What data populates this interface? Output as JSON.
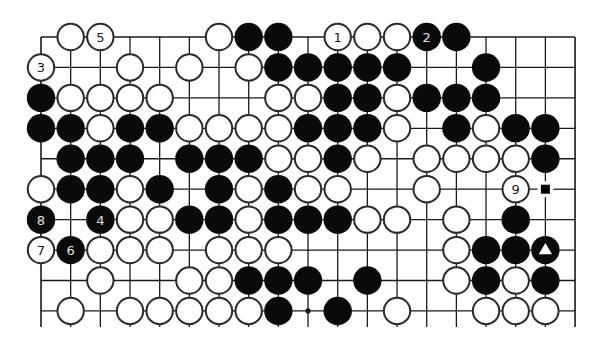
{
  "diagram": {
    "type": "go-board-fragment",
    "grid": {
      "origin_x": 41,
      "origin_y": 37,
      "dx": 29.67,
      "dy": 30.44,
      "cols": 19,
      "rows": 10,
      "line_bottom_y": 327,
      "edges": {
        "top": true,
        "left": true,
        "right": true,
        "bottom": false
      },
      "line_color": "#1a1a1a"
    },
    "stone_radius": 13.6,
    "colors": {
      "black": "#0a0a0a",
      "white": "#ffffff",
      "outline": "#2a2a2a",
      "label_on_white": "#1a1a1a",
      "label_on_black": "#e0e0e0"
    },
    "star_points": [
      {
        "row": 9,
        "col": 9
      }
    ],
    "stones": [
      {
        "r": 0,
        "c": 1,
        "color": "W"
      },
      {
        "r": 0,
        "c": 2,
        "color": "W",
        "label": "5"
      },
      {
        "r": 0,
        "c": 6,
        "color": "W"
      },
      {
        "r": 0,
        "c": 7,
        "color": "B"
      },
      {
        "r": 0,
        "c": 8,
        "color": "B"
      },
      {
        "r": 0,
        "c": 10,
        "color": "W",
        "label": "1"
      },
      {
        "r": 0,
        "c": 11,
        "color": "W"
      },
      {
        "r": 0,
        "c": 12,
        "color": "W"
      },
      {
        "r": 0,
        "c": 13,
        "color": "B",
        "label": "2"
      },
      {
        "r": 0,
        "c": 14,
        "color": "B"
      },
      {
        "r": 1,
        "c": 0,
        "color": "W",
        "label": "3"
      },
      {
        "r": 1,
        "c": 3,
        "color": "W"
      },
      {
        "r": 1,
        "c": 5,
        "color": "W"
      },
      {
        "r": 1,
        "c": 7,
        "color": "W"
      },
      {
        "r": 1,
        "c": 8,
        "color": "B"
      },
      {
        "r": 1,
        "c": 9,
        "color": "B"
      },
      {
        "r": 1,
        "c": 10,
        "color": "B"
      },
      {
        "r": 1,
        "c": 11,
        "color": "B"
      },
      {
        "r": 1,
        "c": 12,
        "color": "B"
      },
      {
        "r": 1,
        "c": 15,
        "color": "B"
      },
      {
        "r": 2,
        "c": 0,
        "color": "B"
      },
      {
        "r": 2,
        "c": 1,
        "color": "W"
      },
      {
        "r": 2,
        "c": 2,
        "color": "W"
      },
      {
        "r": 2,
        "c": 3,
        "color": "W"
      },
      {
        "r": 2,
        "c": 4,
        "color": "W"
      },
      {
        "r": 2,
        "c": 8,
        "color": "W"
      },
      {
        "r": 2,
        "c": 9,
        "color": "W"
      },
      {
        "r": 2,
        "c": 10,
        "color": "B"
      },
      {
        "r": 2,
        "c": 11,
        "color": "B"
      },
      {
        "r": 2,
        "c": 12,
        "color": "W"
      },
      {
        "r": 2,
        "c": 13,
        "color": "B"
      },
      {
        "r": 2,
        "c": 14,
        "color": "B"
      },
      {
        "r": 2,
        "c": 15,
        "color": "B"
      },
      {
        "r": 3,
        "c": 0,
        "color": "B"
      },
      {
        "r": 3,
        "c": 1,
        "color": "B"
      },
      {
        "r": 3,
        "c": 2,
        "color": "W"
      },
      {
        "r": 3,
        "c": 3,
        "color": "B"
      },
      {
        "r": 3,
        "c": 4,
        "color": "B"
      },
      {
        "r": 3,
        "c": 5,
        "color": "W"
      },
      {
        "r": 3,
        "c": 6,
        "color": "W"
      },
      {
        "r": 3,
        "c": 7,
        "color": "W"
      },
      {
        "r": 3,
        "c": 8,
        "color": "W"
      },
      {
        "r": 3,
        "c": 9,
        "color": "B"
      },
      {
        "r": 3,
        "c": 10,
        "color": "B"
      },
      {
        "r": 3,
        "c": 11,
        "color": "B"
      },
      {
        "r": 3,
        "c": 12,
        "color": "W"
      },
      {
        "r": 3,
        "c": 14,
        "color": "B"
      },
      {
        "r": 3,
        "c": 15,
        "color": "W"
      },
      {
        "r": 3,
        "c": 16,
        "color": "B"
      },
      {
        "r": 3,
        "c": 17,
        "color": "B"
      },
      {
        "r": 4,
        "c": 1,
        "color": "B"
      },
      {
        "r": 4,
        "c": 2,
        "color": "B"
      },
      {
        "r": 4,
        "c": 3,
        "color": "B"
      },
      {
        "r": 4,
        "c": 5,
        "color": "B"
      },
      {
        "r": 4,
        "c": 6,
        "color": "B"
      },
      {
        "r": 4,
        "c": 7,
        "color": "B"
      },
      {
        "r": 4,
        "c": 8,
        "color": "W"
      },
      {
        "r": 4,
        "c": 9,
        "color": "W"
      },
      {
        "r": 4,
        "c": 10,
        "color": "B"
      },
      {
        "r": 4,
        "c": 11,
        "color": "W"
      },
      {
        "r": 4,
        "c": 13,
        "color": "W"
      },
      {
        "r": 4,
        "c": 14,
        "color": "W"
      },
      {
        "r": 4,
        "c": 15,
        "color": "W"
      },
      {
        "r": 4,
        "c": 16,
        "color": "W"
      },
      {
        "r": 4,
        "c": 17,
        "color": "B"
      },
      {
        "r": 5,
        "c": 0,
        "color": "W"
      },
      {
        "r": 5,
        "c": 1,
        "color": "B"
      },
      {
        "r": 5,
        "c": 2,
        "color": "B"
      },
      {
        "r": 5,
        "c": 3,
        "color": "W"
      },
      {
        "r": 5,
        "c": 4,
        "color": "B"
      },
      {
        "r": 5,
        "c": 6,
        "color": "B"
      },
      {
        "r": 5,
        "c": 7,
        "color": "W"
      },
      {
        "r": 5,
        "c": 8,
        "color": "B"
      },
      {
        "r": 5,
        "c": 9,
        "color": "W"
      },
      {
        "r": 5,
        "c": 10,
        "color": "W"
      },
      {
        "r": 5,
        "c": 13,
        "color": "W"
      },
      {
        "r": 5,
        "c": 16,
        "color": "W",
        "label": "9"
      },
      {
        "r": 6,
        "c": 0,
        "color": "B",
        "label": "8"
      },
      {
        "r": 6,
        "c": 2,
        "color": "B",
        "label": "4"
      },
      {
        "r": 6,
        "c": 3,
        "color": "W"
      },
      {
        "r": 6,
        "c": 4,
        "color": "W"
      },
      {
        "r": 6,
        "c": 5,
        "color": "B"
      },
      {
        "r": 6,
        "c": 6,
        "color": "B"
      },
      {
        "r": 6,
        "c": 7,
        "color": "W"
      },
      {
        "r": 6,
        "c": 8,
        "color": "B"
      },
      {
        "r": 6,
        "c": 9,
        "color": "B"
      },
      {
        "r": 6,
        "c": 10,
        "color": "B"
      },
      {
        "r": 6,
        "c": 11,
        "color": "W"
      },
      {
        "r": 6,
        "c": 12,
        "color": "W"
      },
      {
        "r": 6,
        "c": 14,
        "color": "W"
      },
      {
        "r": 6,
        "c": 16,
        "color": "B"
      },
      {
        "r": 7,
        "c": 0,
        "color": "W",
        "label": "7"
      },
      {
        "r": 7,
        "c": 1,
        "color": "B",
        "label": "6"
      },
      {
        "r": 7,
        "c": 2,
        "color": "W"
      },
      {
        "r": 7,
        "c": 3,
        "color": "W"
      },
      {
        "r": 7,
        "c": 4,
        "color": "W"
      },
      {
        "r": 7,
        "c": 6,
        "color": "W"
      },
      {
        "r": 7,
        "c": 7,
        "color": "W"
      },
      {
        "r": 7,
        "c": 8,
        "color": "W"
      },
      {
        "r": 7,
        "c": 14,
        "color": "W"
      },
      {
        "r": 7,
        "c": 15,
        "color": "B"
      },
      {
        "r": 7,
        "c": 16,
        "color": "B"
      },
      {
        "r": 7,
        "c": 17,
        "color": "B",
        "mark": "triangle"
      },
      {
        "r": 8,
        "c": 2,
        "color": "W"
      },
      {
        "r": 8,
        "c": 5,
        "color": "W"
      },
      {
        "r": 8,
        "c": 6,
        "color": "W"
      },
      {
        "r": 8,
        "c": 7,
        "color": "B"
      },
      {
        "r": 8,
        "c": 8,
        "color": "B"
      },
      {
        "r": 8,
        "c": 9,
        "color": "B"
      },
      {
        "r": 8,
        "c": 11,
        "color": "B"
      },
      {
        "r": 8,
        "c": 14,
        "color": "W"
      },
      {
        "r": 8,
        "c": 15,
        "color": "B"
      },
      {
        "r": 8,
        "c": 16,
        "color": "W"
      },
      {
        "r": 8,
        "c": 17,
        "color": "B"
      },
      {
        "r": 9,
        "c": 1,
        "color": "W"
      },
      {
        "r": 9,
        "c": 3,
        "color": "W"
      },
      {
        "r": 9,
        "c": 4,
        "color": "W"
      },
      {
        "r": 9,
        "c": 5,
        "color": "W"
      },
      {
        "r": 9,
        "c": 6,
        "color": "W"
      },
      {
        "r": 9,
        "c": 7,
        "color": "W"
      },
      {
        "r": 9,
        "c": 8,
        "color": "B"
      },
      {
        "r": 9,
        "c": 10,
        "color": "B"
      },
      {
        "r": 9,
        "c": 12,
        "color": "W"
      },
      {
        "r": 9,
        "c": 15,
        "color": "W"
      },
      {
        "r": 9,
        "c": 16,
        "color": "W"
      },
      {
        "r": 9,
        "c": 17,
        "color": "W"
      }
    ],
    "point_marks": [
      {
        "r": 5,
        "c": 17,
        "mark": "square"
      }
    ]
  }
}
